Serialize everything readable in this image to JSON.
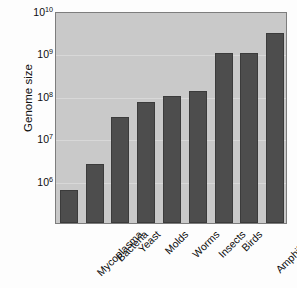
{
  "chart_data": {
    "type": "bar",
    "title": "",
    "xlabel": "",
    "ylabel": "Genome size",
    "yscale": "log",
    "ylim": [
      100000,
      10000000000
    ],
    "grid": true,
    "legend": false,
    "ytick_labels": [
      "10",
      "10",
      "10",
      "10",
      "10"
    ],
    "ytick_exponents": [
      "10",
      "9",
      "8",
      "7",
      "6"
    ],
    "ytick_values": [
      10000000000,
      1000000000,
      100000000,
      10000000,
      1000000
    ],
    "categories": [
      "Mycoplasma",
      "Bacteria",
      "Yeast",
      "Molds",
      "Worms",
      "Insects",
      "Birds",
      "Amphibians",
      "Mammals"
    ],
    "values": [
      600000,
      2500000,
      32000000,
      70000000,
      100000000,
      130000000,
      1050000000,
      1050000000,
      3000000000
    ],
    "bar_color": "#4d4d4d",
    "plot_background": "#c9c9c9",
    "figure_background": "#fdfdfd",
    "axis_color": "#7d7d7d",
    "grid_color": "#d8d8d8"
  }
}
